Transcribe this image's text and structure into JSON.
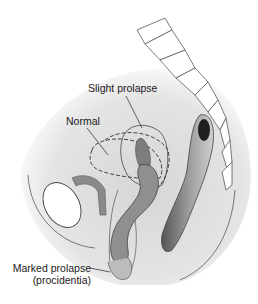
{
  "diagram": {
    "type": "anatomical-illustration",
    "labels": {
      "slight_prolapse": "Slight prolapse",
      "normal": "Normal",
      "marked_prolapse_line1": "Marked prolapse",
      "marked_prolapse_line2": "(procidentia)"
    },
    "colors": {
      "background": "#ffffff",
      "pelvis_fill": "#dcdcdc",
      "pelvis_shadow": "#c8c8c8",
      "organ_fill": "#8a8a8a",
      "organ_light": "#b5b5b5",
      "outline": "#4a4a4a",
      "rectum_dark": "#2a2a2a"
    }
  }
}
